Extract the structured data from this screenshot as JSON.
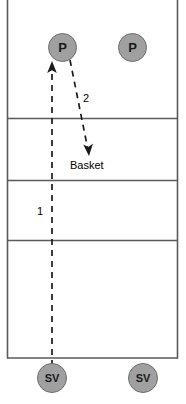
{
  "diagram": {
    "court": {
      "left_boundary_x": 7,
      "right_boundary_x": 178,
      "bottom_boundary_y": 358,
      "zone_lines_y": [
        118,
        180,
        240
      ],
      "line_color": "#5a5a5a",
      "fill_color": "#ffffff"
    },
    "players": [
      {
        "id": "player-left",
        "label": "P",
        "x": 62,
        "y": 47,
        "role": "passer"
      },
      {
        "id": "player-right",
        "label": "P",
        "x": 132,
        "y": 47,
        "role": "passer"
      }
    ],
    "servers": [
      {
        "id": "server-left",
        "label": "SV",
        "x": 52,
        "y": 378,
        "role": "server"
      },
      {
        "id": "server-right",
        "label": "SV",
        "x": 143,
        "y": 378,
        "role": "server"
      }
    ],
    "movements": [
      {
        "id": "movement-1",
        "step_label": "1",
        "step_label_x": 41,
        "step_label_y": 212,
        "style": "dashed",
        "arrowhead": "filled",
        "from": {
          "x": 52,
          "y": 366
        },
        "to": {
          "x": 52,
          "y": 62
        },
        "color": "#1a1a1a",
        "description": "serve travels from server up to passer"
      },
      {
        "id": "movement-2",
        "step_label": "2",
        "step_label_x": 86,
        "step_label_y": 99,
        "style": "dashed",
        "arrowhead": "filled",
        "from": {
          "x": 70,
          "y": 60
        },
        "to": {
          "x": 89,
          "y": 155
        },
        "color": "#1a1a1a",
        "description": "pass travels from passer down to basket target"
      }
    ],
    "annotations": [
      {
        "id": "basket-label",
        "text": "Basket",
        "x": 70,
        "y": 161
      }
    ],
    "colors": {
      "marker_fill": "#a0a0a0",
      "marker_stroke": "#6e6e6e",
      "line": "#5a5a5a",
      "arrow": "#1a1a1a",
      "text": "#000000",
      "background": "#ffffff"
    }
  }
}
